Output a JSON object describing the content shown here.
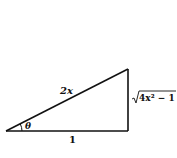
{
  "diagram": {
    "type": "right-triangle",
    "hypotenuse_label": "2x",
    "adjacent_label": "1",
    "opposite_label": "4x² − 1",
    "opposite_has_radical": true,
    "angle_label": "θ",
    "stroke_color": "#111111"
  }
}
